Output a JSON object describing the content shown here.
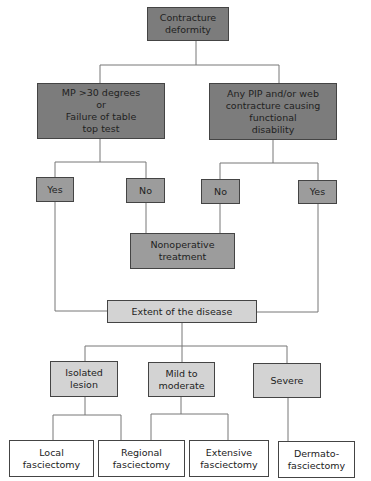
{
  "diagram": {
    "root": {
      "label": "Contracture\ndeformity"
    },
    "criteria": [
      {
        "label": "MP >30 degrees\nor\nFailure of table\ntop test"
      },
      {
        "label": "Any PIP and/or web\ncontracture causing\nfunctional\ndisability"
      }
    ],
    "answers": [
      {
        "label": "Yes"
      },
      {
        "label": "No"
      },
      {
        "label": "No"
      },
      {
        "label": "Yes"
      }
    ],
    "nonoperative": {
      "label": "Nonoperative\ntreatment"
    },
    "extent": {
      "label": "Extent of the disease"
    },
    "severity": [
      {
        "label": "Isolated\nlesion"
      },
      {
        "label": "Mild to\nmoderate"
      },
      {
        "label": "Severe"
      }
    ],
    "treatments": [
      {
        "label": "Local\nfasciectomy"
      },
      {
        "label": "Regional\nfasciectomy"
      },
      {
        "label": "Extensive\nfasciectomy"
      },
      {
        "label": "Dermato-\nfasciectomy"
      }
    ],
    "colors": {
      "dark_fill": "#7c7c7c",
      "mid_fill": "#9c9c9c",
      "light_fill": "#d3d3d3",
      "line": "#777777"
    }
  }
}
